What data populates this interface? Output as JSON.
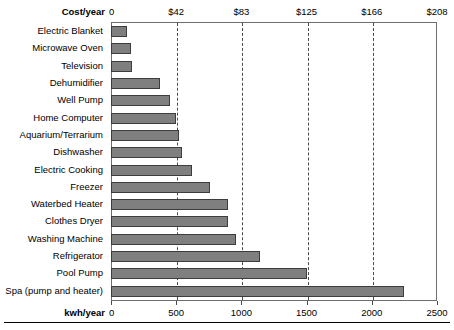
{
  "chart_data": {
    "type": "bar",
    "orientation": "horizontal",
    "title": "",
    "categories": [
      "Electric Blanket",
      "Microwave Oven",
      "Television",
      "Dehumidifier",
      "Well Pump",
      "Home Computer",
      "Aquarium/Terrarium",
      "Dishwasher",
      "Electric Cooking",
      "Freezer",
      "Waterbed Heater",
      "Clothes Dryer",
      "Washing Machine",
      "Refrigerator",
      "Pool Pump",
      "Spa (pump and heater)"
    ],
    "values": [
      120,
      150,
      160,
      375,
      450,
      500,
      520,
      545,
      620,
      760,
      900,
      900,
      960,
      1140,
      1500,
      2250
    ],
    "xlabel": "kwh/year",
    "secondary_xlabel": "Cost/year",
    "ylabel": "",
    "xlim": [
      0,
      2500
    ],
    "xticks": [
      0,
      500,
      1000,
      1500,
      2000,
      2500
    ],
    "xticklabels": [
      "0",
      "500",
      "1000",
      "1500",
      "2000",
      "2500"
    ],
    "secondary_xticks": [
      0,
      500,
      1000,
      1500,
      2000,
      2500
    ],
    "secondary_xticklabels": [
      "0",
      "$42",
      "$83",
      "$125",
      "$166",
      "$208"
    ],
    "grid": true,
    "gridlines_at": [
      500,
      1000,
      1500,
      2000
    ],
    "legend": null,
    "bar_color": "#7f7f7f",
    "bar_edge_color": "#3d3d3d",
    "frame_color": "#6e6e6e",
    "background": "#ffffff"
  },
  "axes": {
    "top_label": "Cost/year",
    "bottom_label": "kwh/year"
  }
}
